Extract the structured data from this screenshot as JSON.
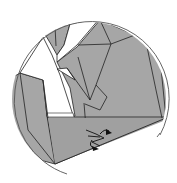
{
  "diagram": {
    "type": "origami-step-inset",
    "title": "",
    "caption": "",
    "colors": {
      "paper_color_side": "#a6a6a6",
      "paper_white_side": "#ffffff",
      "line": "#222222",
      "circle_outline": "#555555",
      "arrow": "#111111"
    },
    "elements": [
      {
        "name": "circular-inset-frame",
        "kind": "circle"
      },
      {
        "name": "folded-paper-model",
        "kind": "polygons"
      },
      {
        "name": "fold-arrow",
        "kind": "arrow",
        "description": "curved arrow indicating fold near center bottom"
      }
    ]
  }
}
